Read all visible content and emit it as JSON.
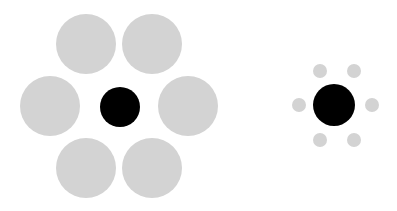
{
  "colors": {
    "inducer": "#d3d3d3",
    "target": "#000000",
    "background": "#ffffff"
  },
  "left_group": {
    "target": {
      "cx": 120,
      "cy": 107,
      "r": 20
    },
    "inducers": [
      {
        "cx": 86,
        "cy": 44,
        "r": 30
      },
      {
        "cx": 152,
        "cy": 44,
        "r": 30
      },
      {
        "cx": 50,
        "cy": 106,
        "r": 30
      },
      {
        "cx": 188,
        "cy": 106,
        "r": 30
      },
      {
        "cx": 86,
        "cy": 168,
        "r": 30
      },
      {
        "cx": 152,
        "cy": 168,
        "r": 30
      }
    ]
  },
  "right_group": {
    "target": {
      "cx": 334,
      "cy": 105,
      "r": 21
    },
    "inducers": [
      {
        "cx": 320,
        "cy": 71,
        "r": 7
      },
      {
        "cx": 354,
        "cy": 71,
        "r": 7
      },
      {
        "cx": 299,
        "cy": 105,
        "r": 7
      },
      {
        "cx": 372,
        "cy": 105,
        "r": 7
      },
      {
        "cx": 320,
        "cy": 140,
        "r": 7
      },
      {
        "cx": 354,
        "cy": 140,
        "r": 7
      }
    ]
  }
}
